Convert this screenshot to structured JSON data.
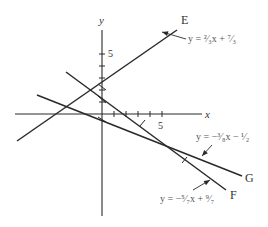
{
  "diagram": {
    "type": "coordinate-plane-lines",
    "axes": {
      "x_label": "x",
      "y_label": "y",
      "x_tick_label": "5",
      "y_tick_label": "5",
      "unit_px": 12,
      "origin_px": [
        102,
        114
      ]
    },
    "lines": [
      {
        "name": "E",
        "equation": "y = ²⁄₃x + ⁷⁄₃",
        "slope": "2/3",
        "intercept": "7/3",
        "from": [
          17,
          141
        ],
        "to": [
          177,
          30
        ],
        "label_pos": [
          181,
          24
        ],
        "eq_pos": [
          188,
          42
        ],
        "arrow_from": [
          186,
          39
        ],
        "arrow_to": [
          162,
          32
        ]
      },
      {
        "name": "F",
        "equation": "y = −⁵⁄₇x + ⁹⁄₇",
        "slope": "-5/7",
        "intercept": "9/7",
        "from": [
          66,
          72
        ],
        "to": [
          226,
          190
        ],
        "label_pos": [
          230,
          199
        ],
        "eq_pos": [
          160,
          202
        ],
        "arrow_from": [
          193,
          190
        ],
        "arrow_to": [
          210,
          180
        ]
      },
      {
        "name": "G",
        "equation": "y = −³⁄₈x − ¹⁄₂",
        "slope": "-3/8",
        "intercept": "-1/2",
        "from": [
          37,
          95
        ],
        "to": [
          242,
          176
        ],
        "label_pos": [
          245,
          182
        ],
        "eq_pos": [
          196,
          140
        ],
        "arrow_from": [
          212,
          145
        ],
        "arrow_to": [
          202,
          156
        ]
      }
    ]
  }
}
